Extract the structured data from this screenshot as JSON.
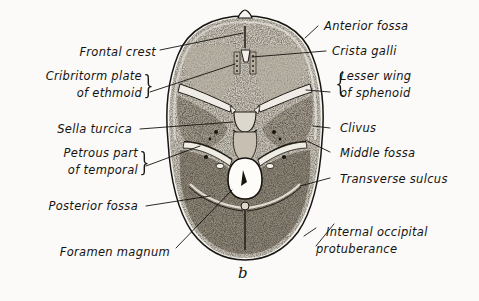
{
  "figure": {
    "kind": "anatomical-illustration",
    "caption": "b",
    "background_color": "#fbfaf8",
    "ink_color": "#15130f"
  },
  "labels_left": [
    {
      "id": "frontal-crest",
      "text": "Frontal crest",
      "text2": "",
      "brace": false
    },
    {
      "id": "cribriform-plate",
      "text": "Cribritorm plate",
      "text2": "of  ethmoid",
      "brace": true
    },
    {
      "id": "sella-turcica",
      "text": "Sella turcica",
      "text2": "",
      "brace": false
    },
    {
      "id": "petrous-part",
      "text": "Petrous part",
      "text2": "of  temporal",
      "brace": true
    },
    {
      "id": "posterior-fossa",
      "text": "Posterior fossa",
      "text2": "",
      "brace": false
    },
    {
      "id": "foramen-magnum",
      "text": "Foramen magnum",
      "text2": "",
      "brace": false
    }
  ],
  "labels_right": [
    {
      "id": "anterior-fossa",
      "text": "Anterior fossa",
      "text2": "",
      "brace": false
    },
    {
      "id": "crista-galli",
      "text": "Crista galli",
      "text2": "",
      "brace": false
    },
    {
      "id": "lesser-wing",
      "text": "Lesser wing",
      "text2": "of sphenoid",
      "brace": true
    },
    {
      "id": "clivus",
      "text": "Clivus",
      "text2": "",
      "brace": false
    },
    {
      "id": "middle-fossa",
      "text": "Middle fossa",
      "text2": "",
      "brace": false
    },
    {
      "id": "transverse-sulcus",
      "text": "Transverse sulcus",
      "text2": "",
      "brace": false
    },
    {
      "id": "internal-occipital",
      "text": "Internal occipital",
      "text2": "protuberance",
      "brace": false
    }
  ],
  "braces": {
    "cribriform": "}",
    "petrous": "}",
    "lesser_wing": "{"
  }
}
